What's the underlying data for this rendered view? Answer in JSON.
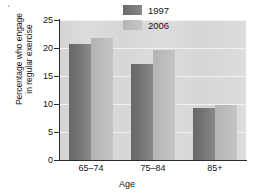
{
  "chart_data": {
    "type": "bar",
    "title": "",
    "subtitle": "",
    "xlabel": "Age",
    "ylabel": "Percentage who engage in regular exercise",
    "ylabel_line1": "Percentage who engage",
    "ylabel_line2": "in regular exercise",
    "categories": [
      "65–74",
      "75–84",
      "85+"
    ],
    "series": [
      {
        "name": "1997",
        "color": "#6e6e6e",
        "values": [
          20.7,
          17.1,
          9.2
        ]
      },
      {
        "name": "2006",
        "color": "#bdbdbd",
        "values": [
          21.7,
          19.7,
          9.9
        ]
      }
    ],
    "ylim": [
      0,
      25
    ],
    "ytick_values": [
      0,
      5,
      10,
      15,
      20,
      25
    ],
    "ytick_labels": [
      "0",
      "5",
      "10",
      "15",
      "20",
      "25"
    ],
    "grid": "horizontal",
    "gridline_color": "#f2f2f2",
    "plot_background": "#d9d9d9",
    "legend_position": "top-right",
    "legend": [
      {
        "label": "1997",
        "swatch": "dark-gray"
      },
      {
        "label": "2006",
        "swatch": "light-gray"
      }
    ]
  }
}
